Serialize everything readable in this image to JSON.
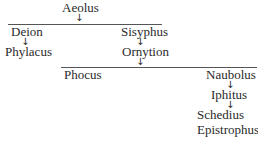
{
  "diagram": {
    "type": "genealogy-tree",
    "root": {
      "label": "Aeolus"
    },
    "level1": [
      {
        "label": "Deion",
        "child": "Phylacus"
      },
      {
        "label": "Sisyphus",
        "child": "Ornytion"
      }
    ],
    "level2": [
      {
        "label": "Phocus"
      },
      {
        "label": "Naubolus",
        "child": "Iphitus",
        "grandchildren": [
          "Schedius",
          "Epistrophus"
        ]
      }
    ],
    "arrow_glyph": "↓"
  }
}
